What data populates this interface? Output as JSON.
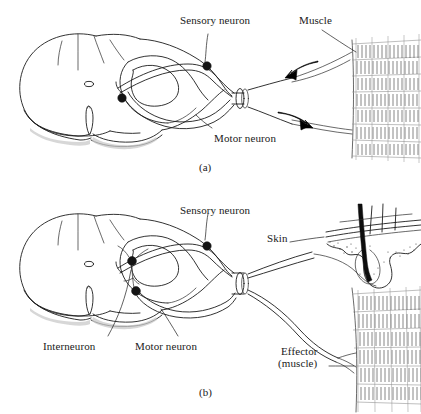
{
  "figure": {
    "background_color": "#ffffff",
    "ink_color": "#1c1c1c"
  },
  "panels": [
    {
      "id": "a",
      "caption": "(a)",
      "description": "Monosynaptic reflex arc: sensory neuron synapsing directly on motor neuron, with muscle as receptor and effector",
      "labels": [
        {
          "name": "sensory-neuron",
          "text": "Sensory neuron"
        },
        {
          "name": "muscle",
          "text": "Muscle"
        },
        {
          "name": "motor-neuron",
          "text": "Motor neuron"
        }
      ],
      "arrows": [
        {
          "name": "afferent-arrow",
          "direction": "left",
          "meaning": "impulse toward spinal cord"
        },
        {
          "name": "efferent-arrow",
          "direction": "right",
          "meaning": "impulse toward muscle"
        }
      ],
      "cell_bodies": [
        {
          "name": "dorsal-root-ganglion",
          "label": "Sensory neuron"
        },
        {
          "name": "motor-neuron-soma",
          "label": "Motor neuron"
        }
      ]
    },
    {
      "id": "b",
      "caption": "(b)",
      "description": "Polysynaptic reflex arc: sensory neuron from skin synapsing on interneuron, which synapses on motor neuron projecting to effector muscle",
      "labels": [
        {
          "name": "sensory-neuron",
          "text": "Sensory neuron"
        },
        {
          "name": "skin",
          "text": "Skin"
        },
        {
          "name": "interneuron",
          "text": "Interneuron"
        },
        {
          "name": "motor-neuron",
          "text": "Motor neuron"
        },
        {
          "name": "effector-line1",
          "text": "Effector"
        },
        {
          "name": "effector-line2",
          "text": "(muscle)"
        }
      ],
      "cell_bodies": [
        {
          "name": "dorsal-root-ganglion",
          "label": "Sensory neuron"
        },
        {
          "name": "interneuron-soma",
          "label": "Interneuron"
        },
        {
          "name": "motor-neuron-soma",
          "label": "Motor neuron"
        }
      ]
    }
  ],
  "anatomy": {
    "spinal_cord": {
      "name": "spinal-cord-cross-section",
      "features": [
        "central canal",
        "ventral median fissure",
        "gray matter butterfly",
        "white matter",
        "dorsal root",
        "ventral root",
        "spinal nerve"
      ]
    },
    "skin": {
      "name": "skin-section",
      "features": [
        "epidermis",
        "dermis",
        "hair shaft",
        "hair follicle"
      ]
    },
    "muscle": {
      "name": "striated-muscle",
      "features": [
        "muscle bands",
        "striations"
      ]
    }
  }
}
